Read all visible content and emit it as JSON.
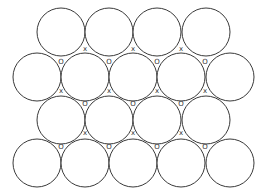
{
  "diagram": {
    "title": "",
    "stroke_color": "#3a3a3a",
    "radius": 24,
    "rows": [
      {
        "y": 32,
        "x": [
          61,
          109,
          157,
          206
        ]
      },
      {
        "y": 77,
        "x": [
          37,
          85,
          133,
          181,
          230
        ]
      },
      {
        "y": 120,
        "x": [
          61,
          109,
          157,
          206
        ]
      },
      {
        "y": 163,
        "x": [
          37,
          85,
          133,
          181,
          230
        ]
      }
    ],
    "labels": [
      {
        "text": "x",
        "x": 85,
        "y": 49
      },
      {
        "text": "x",
        "x": 133,
        "y": 49
      },
      {
        "text": "x",
        "x": 181,
        "y": 49
      },
      {
        "text": "O",
        "x": 61,
        "y": 62
      },
      {
        "text": "O",
        "x": 109,
        "y": 62
      },
      {
        "text": "O",
        "x": 157,
        "y": 62
      },
      {
        "text": "O",
        "x": 205,
        "y": 62
      },
      {
        "text": "x",
        "x": 61,
        "y": 91
      },
      {
        "text": "x",
        "x": 109,
        "y": 91
      },
      {
        "text": "x",
        "x": 157,
        "y": 91
      },
      {
        "text": "x",
        "x": 205,
        "y": 91
      },
      {
        "text": "O",
        "x": 85,
        "y": 104
      },
      {
        "text": "O",
        "x": 133,
        "y": 104
      },
      {
        "text": "O",
        "x": 181,
        "y": 104
      },
      {
        "text": "x",
        "x": 85,
        "y": 133
      },
      {
        "text": "x",
        "x": 133,
        "y": 133
      },
      {
        "text": "x",
        "x": 181,
        "y": 133
      },
      {
        "text": "O",
        "x": 61,
        "y": 147
      },
      {
        "text": "O",
        "x": 109,
        "y": 147
      },
      {
        "text": "O",
        "x": 157,
        "y": 147
      },
      {
        "text": "O",
        "x": 205,
        "y": 147
      }
    ],
    "legend": {
      "O": "octahedral site",
      "x": "tetrahedral site"
    }
  }
}
